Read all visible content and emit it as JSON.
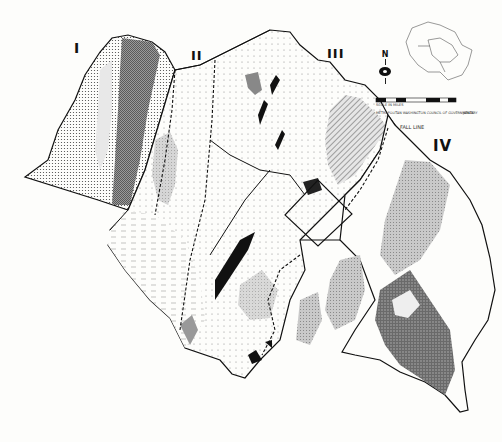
{
  "map": {
    "region_labels": [
      {
        "id": "I",
        "text": "I"
      },
      {
        "id": "II",
        "text": "II"
      },
      {
        "id": "III",
        "text": "III"
      },
      {
        "id": "IV",
        "text": "IV"
      }
    ],
    "fall_line_label": "FALL LINE",
    "north_arrow_label": "N",
    "scale_caption": "SCALE IN MILES",
    "scale_ticks": [
      "0",
      "4",
      "8",
      "12"
    ],
    "credit": "METROPOLITAN WASHINGTON COUNCIL OF GOVERNMENTS",
    "date": "JANUARY"
  },
  "colors": {
    "background": "#fdfdfb",
    "ink": "#111111",
    "dark_fill": "#6e6e6e",
    "medium_fill": "#a9a9a9",
    "light_fill": "#d4d4d4"
  }
}
